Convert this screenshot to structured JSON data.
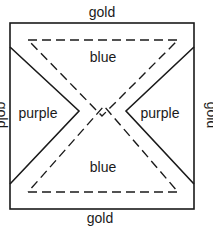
{
  "diagram": {
    "labels": {
      "top": "gold",
      "bottom": "gold",
      "left": "gold",
      "right": "gold",
      "top_region": "blue",
      "bottom_region": "blue",
      "left_region": "purple",
      "right_region": "purple"
    },
    "line_color": "#1a1a1a"
  }
}
